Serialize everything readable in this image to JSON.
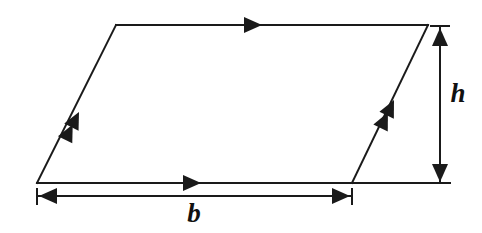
{
  "figure": {
    "background_color": "#ffffff",
    "stroke_color": "#1a1a1a",
    "stroke_width": 2,
    "canvas": {
      "width": 482,
      "height": 233
    }
  },
  "shape": {
    "name": "parallelogram",
    "vertices": {
      "top_left": {
        "x": 116,
        "y": 25
      },
      "top_right": {
        "x": 428,
        "y": 25
      },
      "bottom_right": {
        "x": 352,
        "y": 183
      },
      "bottom_left": {
        "x": 37,
        "y": 183
      }
    },
    "edges": [
      {
        "id": "top-edge",
        "from": "top_left",
        "to": "top_right",
        "tick_marks": 1,
        "direction": "right"
      },
      {
        "id": "bottom-edge",
        "from": "bottom_left",
        "to": "bottom_right",
        "tick_marks": 1,
        "direction": "right"
      },
      {
        "id": "left-edge",
        "from": "bottom_left",
        "to": "top_left",
        "tick_marks": 2,
        "direction": "up-right"
      },
      {
        "id": "right-edge",
        "from": "bottom_right",
        "to": "top_right",
        "tick_marks": 2,
        "direction": "up-right"
      }
    ]
  },
  "dimensions": {
    "base": {
      "label": "b",
      "orientation": "horizontal",
      "line_y": 196,
      "start_x": 37,
      "end_x": 352,
      "label_position": {
        "x": 194,
        "y": 222
      },
      "arrow_style": "double-headed-with-end-ticks"
    },
    "height": {
      "label": "h",
      "orientation": "vertical",
      "line_x": 440,
      "start_y": 27,
      "end_y": 183,
      "label_position": {
        "x": 458,
        "y": 102
      },
      "arrow_style": "double-headed-with-end-ticks"
    }
  },
  "extension_lines": [
    {
      "id": "top-extension-tick",
      "x1": 431,
      "y1": 26,
      "x2": 449,
      "y2": 26
    },
    {
      "id": "baseline-extension",
      "x1": 352,
      "y1": 183,
      "x2": 450,
      "y2": 183
    }
  ]
}
